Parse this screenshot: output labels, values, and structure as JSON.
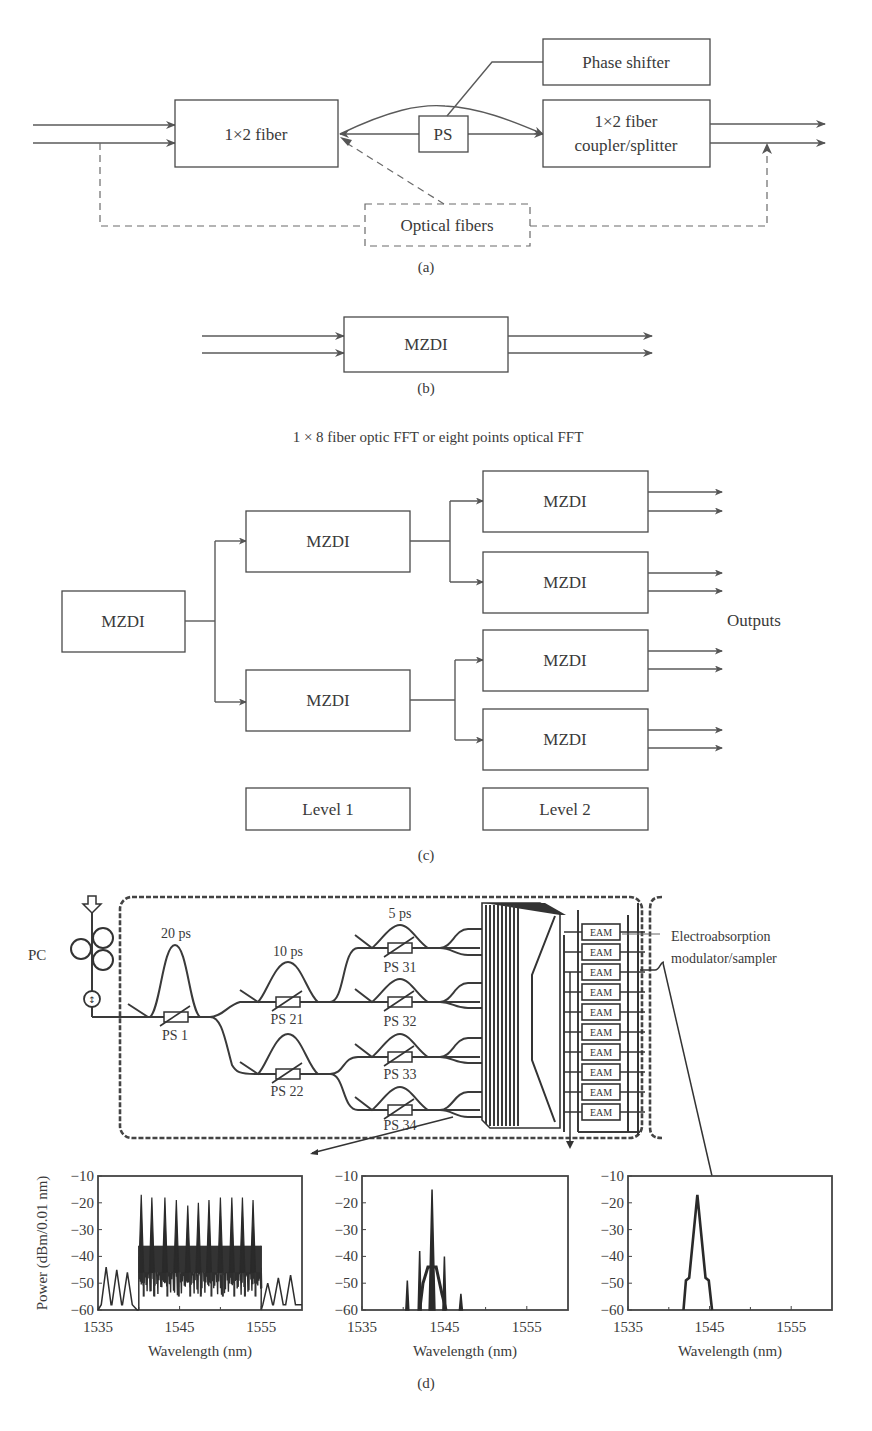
{
  "panel_a": {
    "box_1x2": "1×2 fiber",
    "ps_box": "PS",
    "phase_shifter": "Phase shifter",
    "coupler_line1": "1×2 fiber",
    "coupler_line2": "coupler/splitter",
    "optical_fibers": "Optical fibers",
    "caption": "(a)"
  },
  "panel_b": {
    "box": "MZDI",
    "caption": "(b)"
  },
  "panel_c": {
    "title": "1 × 8 fiber optic FFT or eight points optical FFT",
    "root_box": "MZDI",
    "level1_boxes": [
      "MZDI",
      "MZDI"
    ],
    "level2_boxes": [
      "MZDI",
      "MZDI",
      "MZDI",
      "MZDI"
    ],
    "outputs_label": "Outputs",
    "level1_label": "Level 1",
    "level2_label": "Level 2",
    "caption": "(c)"
  },
  "panel_d": {
    "pc_label": "PC",
    "pulse_labels": [
      "20 ps",
      "10 ps",
      "5 ps"
    ],
    "ps_labels": [
      "PS 1",
      "PS 21",
      "PS 22",
      "PS 31",
      "PS 32",
      "PS 33",
      "PS 34"
    ],
    "eam_label": "EAM",
    "eam_count": 10,
    "eam_annotation_line1": "Electroabsorption",
    "eam_annotation_line2": "modulator/sampler",
    "caption": "(d)"
  },
  "chart_data": [
    {
      "type": "line",
      "title": "Input spectrum (12-carrier comb)",
      "xlabel": "Wavelength (nm)",
      "ylabel": "Power (dBm/0.01 nm)",
      "xlim": [
        1535,
        1560
      ],
      "ylim": [
        -60,
        -10
      ],
      "xticks": [
        1535,
        1545,
        1555
      ],
      "yticks": [
        -10,
        -20,
        -30,
        -40,
        -50,
        -60
      ],
      "peaks_x": [
        1540.3,
        1541.6,
        1543.2,
        1544.6,
        1546.0,
        1547.3,
        1548.6,
        1550.0,
        1551.4,
        1552.7,
        1554.0
      ],
      "peaks_y": [
        -17,
        -18,
        -18,
        -19,
        -21,
        -20,
        -19,
        -18,
        -18,
        -18,
        -19
      ],
      "noise_floor": -42,
      "out_of_band_peaks_x": [
        1536.0,
        1537.3,
        1538.6,
        1555.8,
        1557.1,
        1558.6
      ],
      "out_of_band_peaks_y": [
        -44,
        -45,
        -46,
        -50,
        -48,
        -47
      ]
    },
    {
      "type": "line",
      "title": "After FFT (single output port)",
      "xlabel": "Wavelength (nm)",
      "ylabel": "",
      "xlim": [
        1535,
        1560
      ],
      "ylim": [
        -60,
        -10
      ],
      "xticks": [
        1535,
        1545,
        1555
      ],
      "yticks": [
        -10,
        -20,
        -30,
        -40,
        -50,
        -60
      ],
      "peaks_x": [
        1540.5,
        1542.0,
        1543.5,
        1545.0,
        1547.0
      ],
      "peaks_y": [
        -49,
        -38,
        -15,
        -40,
        -54
      ]
    },
    {
      "type": "line",
      "title": "After EAM sampler",
      "xlabel": "Wavelength (nm)",
      "ylabel": "",
      "xlim": [
        1535,
        1560
      ],
      "ylim": [
        -60,
        -10
      ],
      "xticks": [
        1535,
        1545,
        1555
      ],
      "yticks": [
        -10,
        -20,
        -30,
        -40,
        -50,
        -60
      ],
      "peaks_x": [
        1542.3,
        1543.5,
        1544.8
      ],
      "peaks_y": [
        -48,
        -17,
        -49
      ]
    }
  ]
}
